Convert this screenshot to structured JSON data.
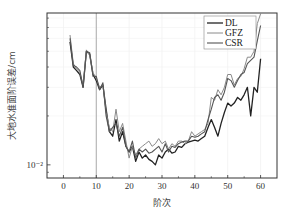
{
  "chart_data": {
    "type": "line",
    "title": "",
    "xlabel": "阶次",
    "ylabel": "大地水准面阶误差/cm",
    "xlim": [
      -5,
      65
    ],
    "ylim": [
      0.0083,
      0.086
    ],
    "yscale": "log",
    "x_ticks": [
      0,
      10,
      20,
      30,
      40,
      50,
      60
    ],
    "x_tick_labels": [
      "0",
      "10",
      "20",
      "30",
      "40",
      "50",
      "60"
    ],
    "y_ticks": [
      0.01
    ],
    "y_tick_labels": [
      "10⁻²"
    ],
    "grid": true,
    "reference_line_x": 10,
    "legend": {
      "position": "top-right",
      "entries": [
        "DL",
        "GFZ",
        "CSR"
      ]
    },
    "x": [
      2,
      3,
      4,
      5,
      6,
      7,
      8,
      9,
      10,
      11,
      12,
      13,
      14,
      15,
      16,
      17,
      18,
      19,
      20,
      21,
      22,
      23,
      24,
      25,
      26,
      27,
      28,
      29,
      30,
      31,
      32,
      33,
      34,
      35,
      36,
      37,
      38,
      39,
      40,
      41,
      42,
      43,
      44,
      45,
      46,
      47,
      48,
      49,
      50,
      51,
      52,
      53,
      54,
      55,
      56,
      57,
      58,
      59,
      60
    ],
    "series": [
      {
        "name": "DL",
        "color": "#222222",
        "values": [
          0.057,
          0.04,
          0.038,
          0.036,
          0.03,
          0.05,
          0.048,
          0.036,
          0.033,
          0.029,
          0.031,
          0.022,
          0.016,
          0.015,
          0.019,
          0.014,
          0.016,
          0.013,
          0.012,
          0.013,
          0.0105,
          0.012,
          0.011,
          0.0115,
          0.0108,
          0.0105,
          0.01,
          0.0115,
          0.011,
          0.012,
          0.0125,
          0.0118,
          0.012,
          0.013,
          0.0128,
          0.0135,
          0.0138,
          0.014,
          0.0142,
          0.014,
          0.0145,
          0.015,
          0.017,
          0.019,
          0.017,
          0.015,
          0.018,
          0.021,
          0.024,
          0.023,
          0.024,
          0.026,
          0.025,
          0.027,
          0.03,
          0.02,
          0.03,
          0.028,
          0.045
        ]
      },
      {
        "name": "GFZ",
        "color": "#8a8a8a",
        "values": [
          0.063,
          0.042,
          0.039,
          0.037,
          0.031,
          0.051,
          0.047,
          0.037,
          0.034,
          0.03,
          0.031,
          0.021,
          0.017,
          0.016,
          0.022,
          0.016,
          0.018,
          0.014,
          0.011,
          0.013,
          0.0115,
          0.0125,
          0.013,
          0.0135,
          0.014,
          0.013,
          0.0135,
          0.0145,
          0.0135,
          0.014,
          0.0125,
          0.0135,
          0.013,
          0.014,
          0.014,
          0.0135,
          0.014,
          0.016,
          0.015,
          0.0155,
          0.016,
          0.0165,
          0.018,
          0.026,
          0.025,
          0.029,
          0.027,
          0.03,
          0.036,
          0.036,
          0.031,
          0.034,
          0.035,
          0.039,
          0.046,
          0.046,
          0.05,
          0.074,
          0.085
        ]
      },
      {
        "name": "CSR",
        "color": "#555555",
        "values": [
          0.06,
          0.041,
          0.04,
          0.038,
          0.03,
          0.05,
          0.049,
          0.035,
          0.035,
          0.029,
          0.032,
          0.02,
          0.016,
          0.017,
          0.018,
          0.015,
          0.017,
          0.013,
          0.012,
          0.014,
          0.011,
          0.0125,
          0.012,
          0.0125,
          0.0118,
          0.012,
          0.0125,
          0.013,
          0.012,
          0.0135,
          0.012,
          0.013,
          0.0128,
          0.0135,
          0.0138,
          0.014,
          0.014,
          0.015,
          0.0148,
          0.015,
          0.0155,
          0.016,
          0.019,
          0.022,
          0.026,
          0.027,
          0.025,
          0.028,
          0.034,
          0.033,
          0.03,
          0.033,
          0.036,
          0.037,
          0.042,
          0.044,
          0.046,
          0.058,
          0.072
        ]
      }
    ]
  }
}
